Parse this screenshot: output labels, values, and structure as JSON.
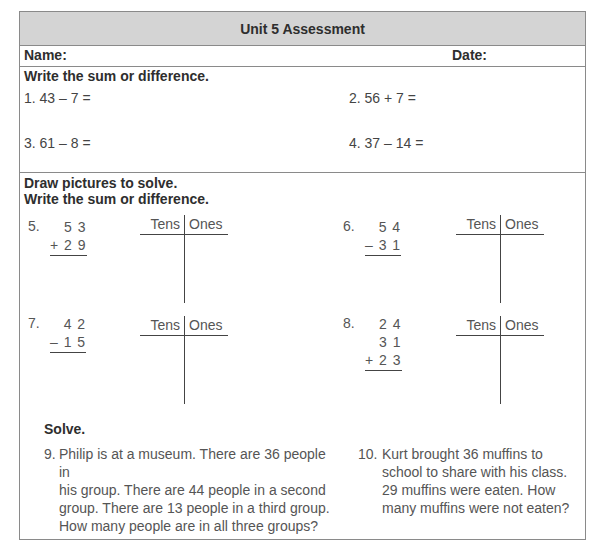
{
  "header": {
    "title": "Unit 5 Assessment"
  },
  "name_row": {
    "name_label": "Name:",
    "date_label": "Date:"
  },
  "section1": {
    "instruction": "Write the sum or difference.",
    "problems": [
      {
        "text": "1. 43 – 7 ="
      },
      {
        "text": "2. 56 + 7 ="
      },
      {
        "text": "3. 61 – 8 ="
      },
      {
        "text": "4. 37 – 14 ="
      }
    ]
  },
  "section2": {
    "instruction_line1": "Draw pictures to solve.",
    "instruction_line2": "Write the sum or difference.",
    "tchart": {
      "tens": "Tens",
      "ones": "Ones"
    },
    "problems": [
      {
        "number": "5.",
        "rows": [
          "5 3",
          "+ 2 9"
        ]
      },
      {
        "number": "6.",
        "rows": [
          "5 4",
          "– 3 1"
        ]
      },
      {
        "number": "7.",
        "rows": [
          "4 2",
          "– 1 5"
        ]
      },
      {
        "number": "8.",
        "rows": [
          "2 4",
          "3 1",
          "+ 2 3"
        ]
      }
    ]
  },
  "section3": {
    "instruction": "Solve.",
    "problems": [
      {
        "number": "9.",
        "lines": [
          "Philip is at a museum. There are 36 people in",
          "his group. There are 44 people in a second",
          "group. There are 13 people in a third group.",
          "How many people are in all three groups?"
        ]
      },
      {
        "number": "10.",
        "lines": [
          "Kurt brought 36 muffins to",
          "school to share with his class.",
          "29 muffins were eaten. How",
          "many muffins were not eaten?"
        ]
      }
    ]
  }
}
